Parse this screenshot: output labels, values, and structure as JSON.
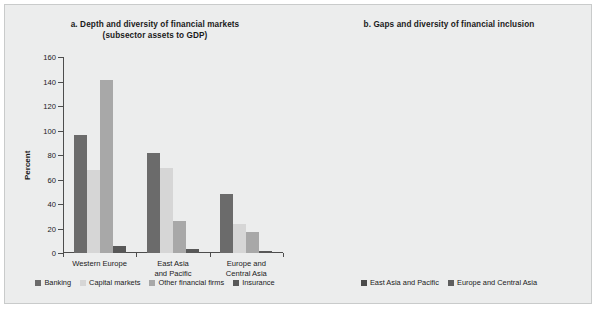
{
  "figure": {
    "background": "#eceded",
    "border_color": "#c9cbcb"
  },
  "chart_data": [
    {
      "id": "a",
      "type": "bar",
      "title": "a. Depth and diversity of financial markets\n(subsector assets to GDP)",
      "title_line1": "a. Depth and diversity of financial markets",
      "title_line2": "(subsector assets to GDP)",
      "xlabel": "",
      "ylabel": "Percent",
      "ylim": [
        0,
        160
      ],
      "yticks": [
        0,
        20,
        40,
        60,
        80,
        100,
        120,
        140,
        160
      ],
      "ytick_labels": [
        "0",
        "20",
        "40",
        "60",
        "80",
        "100",
        "120",
        "140",
        "160"
      ],
      "grid": false,
      "legend_position": "bottom",
      "categories": [
        "Western Europe",
        "East Asia\nand Pacific",
        "Europe and\nCentral Asia"
      ],
      "category_labels": [
        "Western Europe",
        "East Asia and Pacific",
        "Europe and Central Asia"
      ],
      "series": [
        {
          "name": "Banking",
          "color": "#6b6b6b",
          "values": [
            96,
            82,
            48
          ]
        },
        {
          "name": "Capital markets",
          "color": "#d6d6d6",
          "values": [
            68,
            69,
            24
          ]
        },
        {
          "name": "Other financial firms",
          "color": "#a8a8a8",
          "values": [
            141,
            26,
            17
          ]
        },
        {
          "name": "Insurance",
          "color": "#585858",
          "values": [
            6,
            3,
            2
          ]
        }
      ]
    },
    {
      "id": "b",
      "type": "bar",
      "title": "b. Gaps and diversity of financial inclusion",
      "title_line1": "b. Gaps and diversity of financial inclusion",
      "title_line2": "",
      "xlabel": "",
      "ylabel": "Share of adult population (%)",
      "ylim": [
        0,
        90
      ],
      "yticks": [
        0,
        10,
        20,
        30,
        40,
        50,
        60,
        70,
        80,
        90
      ],
      "ytick_labels": [
        "0",
        "10",
        "20",
        "30",
        "40",
        "50",
        "60",
        "70",
        "80",
        "90"
      ],
      "grid": false,
      "legend_position": "bottom",
      "categories": [
        "Accounts",
        "Savings",
        "Credit firms",
        "Insurance,\nnonlife"
      ],
      "category_labels": [
        "Accounts",
        "Savings",
        "Credit firms",
        "Insurance, nonlife"
      ],
      "series": [
        {
          "name": "East Asia and Pacific",
          "color": "#4a4a4a",
          "values": [
            79,
            34,
            48,
            58
          ]
        },
        {
          "name": "Europe and Central Asia",
          "color": "#5e5e5e",
          "values": [
            57,
            8,
            37,
            3
          ]
        }
      ]
    }
  ]
}
